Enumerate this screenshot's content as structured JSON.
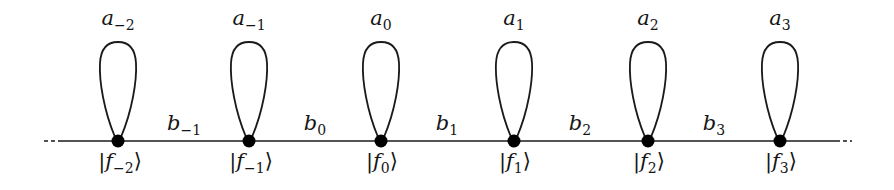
{
  "diagram": {
    "type": "tight-binding chain graph",
    "line_color": "#1a1a1a",
    "node_color": "#000000",
    "baseline_y": 141,
    "left_ellipsis": "...",
    "right_ellipsis": "...",
    "nodes": [
      {
        "x": 118,
        "ket_sym": "f",
        "ket_sub": "−2",
        "loop_sym": "a",
        "loop_sub": "−2"
      },
      {
        "x": 249,
        "ket_sym": "f",
        "ket_sub": "−1",
        "loop_sym": "a",
        "loop_sub": "−1"
      },
      {
        "x": 381,
        "ket_sym": "f",
        "ket_sub": "0",
        "loop_sym": "a",
        "loop_sub": "0"
      },
      {
        "x": 514,
        "ket_sym": "f",
        "ket_sub": "1",
        "loop_sym": "a",
        "loop_sub": "1"
      },
      {
        "x": 648,
        "ket_sym": "f",
        "ket_sub": "2",
        "loop_sym": "a",
        "loop_sub": "2"
      },
      {
        "x": 780,
        "ket_sym": "f",
        "ket_sub": "3",
        "loop_sym": "a",
        "loop_sub": "3"
      }
    ],
    "edges": [
      {
        "x": 184,
        "sym": "b",
        "sub": "−1"
      },
      {
        "x": 315,
        "sym": "b",
        "sub": "0"
      },
      {
        "x": 447,
        "sym": "b",
        "sub": "1"
      },
      {
        "x": 580,
        "sym": "b",
        "sub": "2"
      },
      {
        "x": 714,
        "sym": "b",
        "sub": "3"
      }
    ],
    "ket_open": "|",
    "ket_close": "⟩"
  }
}
